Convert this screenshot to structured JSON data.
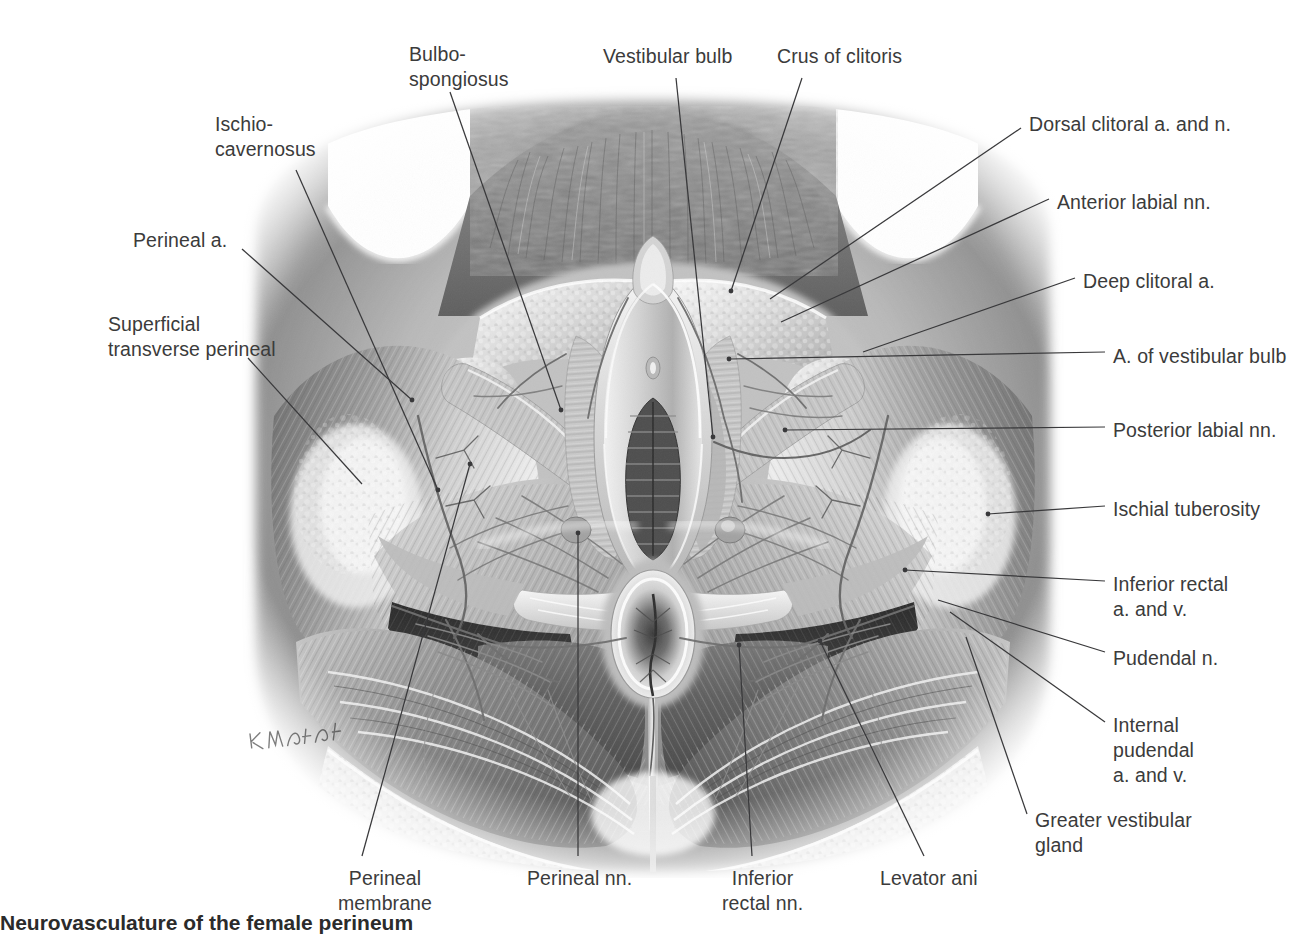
{
  "plate": {
    "title": "Neurovasculature of the female perineum",
    "caption_prefix": "",
    "caption_text": "Neurovasculature of the female perineum",
    "artist_signature": "K. Wesker",
    "text_color": "#3b3b3b",
    "leader_color": "#39393b",
    "background": "#ffffff",
    "view": "Lithotomy position, superficial perineal pouch dissection"
  },
  "labels": {
    "left": [
      {
        "id": "ischiocavernosus",
        "text": "Ischio-\ncavernosus",
        "x": 215,
        "y": 112,
        "align": "left"
      },
      {
        "id": "perineal-artery",
        "text": "Perineal a.",
        "x": 133,
        "y": 228,
        "align": "left"
      },
      {
        "id": "superficial-transverse",
        "text": "Superficial\ntransverse perineal",
        "x": 108,
        "y": 312,
        "align": "left"
      }
    ],
    "top": [
      {
        "id": "bulbospongiosus",
        "text": "Bulbo-\nspongiosus",
        "x": 409,
        "y": 42,
        "align": "left"
      },
      {
        "id": "vestibular-bulb",
        "text": "Vestibular bulb",
        "x": 603,
        "y": 44,
        "align": "left"
      },
      {
        "id": "crus-of-clitoris",
        "text": "Crus of clitoris",
        "x": 777,
        "y": 44,
        "align": "left"
      }
    ],
    "right": [
      {
        "id": "dorsal-clitoral-a-n",
        "text": "Dorsal clitoral a. and n.",
        "x": 1029,
        "y": 112,
        "align": "left"
      },
      {
        "id": "anterior-labial-nn",
        "text": "Anterior labial nn.",
        "x": 1057,
        "y": 190,
        "align": "left"
      },
      {
        "id": "deep-clitoral-a",
        "text": "Deep clitoral a.",
        "x": 1083,
        "y": 269,
        "align": "left"
      },
      {
        "id": "a-of-vestibular-bulb",
        "text": "A. of vestibular bulb",
        "x": 1113,
        "y": 344,
        "align": "left"
      },
      {
        "id": "posterior-labial-nn",
        "text": "Posterior labial nn.",
        "x": 1113,
        "y": 418,
        "align": "left"
      },
      {
        "id": "ischial-tuberosity",
        "text": "Ischial tuberosity",
        "x": 1113,
        "y": 497,
        "align": "left"
      },
      {
        "id": "inferior-rectal-a-v",
        "text": "Inferior rectal\na. and v.",
        "x": 1113,
        "y": 572,
        "align": "left"
      },
      {
        "id": "pudendal-n",
        "text": "Pudendal n.",
        "x": 1113,
        "y": 646,
        "align": "left"
      },
      {
        "id": "internal-pudendal-a-v",
        "text": "Internal\npudendal\na. and v.",
        "x": 1113,
        "y": 713,
        "align": "left"
      },
      {
        "id": "greater-vestibular-gland",
        "text": "Greater vestibular\ngland",
        "x": 1035,
        "y": 808,
        "align": "left"
      }
    ],
    "bottom": [
      {
        "id": "perineal-membrane",
        "text": "Perineal\nmembrane",
        "x": 338,
        "y": 866,
        "align": "left"
      },
      {
        "id": "perineal-nn",
        "text": "Perineal nn.",
        "x": 527,
        "y": 866,
        "align": "left"
      },
      {
        "id": "inferior-rectal-nn",
        "text": "Inferior\nrectal nn.",
        "x": 722,
        "y": 866,
        "align": "left"
      },
      {
        "id": "levator-ani",
        "text": "Levator ani",
        "x": 880,
        "y": 866,
        "align": "left"
      }
    ]
  },
  "leaders": [
    {
      "id": "ischiocavernosus",
      "path": "M 296 170 L 438 490",
      "dot": [
        438,
        490
      ]
    },
    {
      "id": "perineal-artery",
      "path": "M 242 249 L 412 400",
      "dot": [
        412,
        400
      ]
    },
    {
      "id": "superficial-transverse",
      "path": "M 248 358 L 362 484",
      "dot": null
    },
    {
      "id": "bulbospongiosus",
      "path": "M 450 92 L 561 410",
      "dot": [
        561,
        410
      ]
    },
    {
      "id": "vestibular-bulb",
      "path": "M 676 78 L 713 437",
      "dot": [
        713,
        437
      ]
    },
    {
      "id": "crus-of-clitoris",
      "path": "M 802 78 L 731 291",
      "dot": [
        731,
        291
      ]
    },
    {
      "id": "dorsal-clitoral-a-n",
      "path": "M 1021 128 L 770 299",
      "dot": null
    },
    {
      "id": "anterior-labial-nn",
      "path": "M 1049 199 L 781 322",
      "dot": null
    },
    {
      "id": "deep-clitoral-a",
      "path": "M 1075 278 L 863 352",
      "dot": null
    },
    {
      "id": "a-of-vestibular-bulb",
      "path": "M 1105 352 L 729 359",
      "dot": [
        729,
        359
      ]
    },
    {
      "id": "posterior-labial-nn",
      "path": "M 1105 427 L 785 430",
      "dot": [
        785,
        430
      ]
    },
    {
      "id": "ischial-tuberosity",
      "path": "M 1105 506 L 988 514",
      "dot": [
        988,
        514
      ]
    },
    {
      "id": "inferior-rectal-a-v",
      "path": "M 1105 581 L 905 570",
      "dot": [
        905,
        570
      ]
    },
    {
      "id": "pudendal-n",
      "path": "M 1105 652 L 938 600",
      "dot": null
    },
    {
      "id": "internal-pudendal-a-v",
      "path": "M 1105 722 L 950 612",
      "dot": null
    },
    {
      "id": "greater-vestibular-gland",
      "path": "M 1027 814 L 966 637",
      "dot": null
    },
    {
      "id": "perineal-membrane",
      "path": "M 362 856 L 470 464",
      "dot": [
        470,
        464
      ]
    },
    {
      "id": "perineal-nn",
      "path": "M 578 856 L 578 533",
      "dot": [
        578,
        533
      ]
    },
    {
      "id": "inferior-rectal-nn",
      "path": "M 752 856 L 739 645",
      "dot": [
        739,
        645
      ]
    },
    {
      "id": "levator-ani",
      "path": "M 924 856 L 820 641",
      "dot": [
        820,
        641
      ]
    }
  ]
}
